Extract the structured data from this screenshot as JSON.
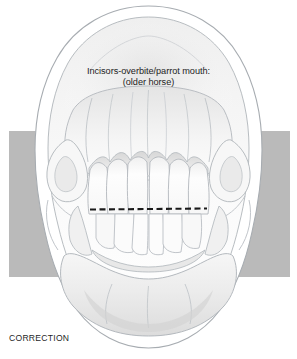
{
  "figure": {
    "title_lines": [
      "Incisors-overbite/parrot mouth:",
      "(older horse)"
    ],
    "corner_label": "CORRECTION",
    "colors": {
      "background": "#ffffff",
      "band_gray": "#bababa",
      "line_ink": "#9ea3a8",
      "dark_ink": "#1d1d1d",
      "shade_light": "#f2f2f2",
      "shade_mid": "#dedede",
      "tooth_fill": "#fbfbfb"
    },
    "band": {
      "name": "gray-background-band",
      "x": 9,
      "y": 131,
      "width": 281,
      "height": 146
    },
    "occlusion_line": {
      "name": "dashed-occlusal-reference-line",
      "x1": 90,
      "y1": 209,
      "x2": 207,
      "y2": 208,
      "style": "dashed",
      "color": "#1a1a1a"
    },
    "upper_incisor_count": 6,
    "lower_incisor_count": 6
  }
}
